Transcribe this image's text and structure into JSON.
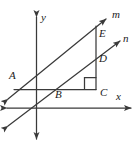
{
  "figure": {
    "type": "geometry-diagram",
    "width": 137,
    "height": 148,
    "stroke_color": "#3a3a3a",
    "background_color": "#ffffff",
    "labels": {
      "line_m": "m",
      "line_n": "n",
      "axis_y": "y",
      "axis_x": "x",
      "point_A": "A",
      "point_B": "B",
      "point_C": "C",
      "point_D": "D",
      "point_E": "E"
    },
    "marks": {
      "right_angle_at": "C"
    }
  }
}
